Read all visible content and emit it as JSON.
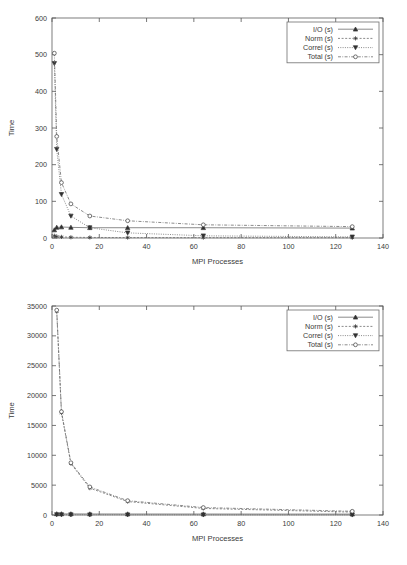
{
  "page": {
    "background_color": "#ffffff",
    "line_color": "#6d6d6d",
    "marker_color": "#2f2f2f",
    "axis_color": "#555555"
  },
  "chart_data": [
    {
      "id": "top",
      "type": "line",
      "title": "",
      "subtitle": "",
      "xlabel": "MPI Processes",
      "ylabel": "Time",
      "xlim": [
        0,
        140
      ],
      "ylim": [
        0,
        600
      ],
      "xticks": [
        0,
        20,
        40,
        60,
        80,
        100,
        120,
        140
      ],
      "xticklabels": [
        "0",
        "20",
        "40",
        "60",
        "80",
        "100",
        "120",
        "140"
      ],
      "yticks": [
        0,
        100,
        200,
        300,
        400,
        500,
        600
      ],
      "yticklabels": [
        "0",
        "100",
        "200",
        "300",
        "400",
        "500",
        "600"
      ],
      "grid": false,
      "legend_position": "upper right",
      "x": [
        1,
        2,
        4,
        8,
        16,
        32,
        64,
        127
      ],
      "series": [
        {
          "name": "I/O (s)",
          "marker": "triangle-up-filled",
          "linestyle": "solid",
          "values": [
            22,
            29,
            30,
            29,
            28,
            28,
            28,
            27
          ]
        },
        {
          "name": "Norm (s)",
          "marker": "star",
          "linestyle": "dashed",
          "values": [
            6,
            4,
            3,
            2,
            1.5,
            1.2,
            1,
            0.9
          ]
        },
        {
          "name": "Correl (s)",
          "marker": "triangle-down-filled",
          "linestyle": "dotted",
          "values": [
            476,
            242,
            119,
            60,
            28,
            14,
            6,
            3
          ]
        },
        {
          "name": "Total (s)",
          "marker": "circle-open",
          "linestyle": "dashdot",
          "values": [
            504,
            277,
            151,
            93,
            60,
            47,
            36,
            31
          ]
        }
      ]
    },
    {
      "id": "bottom",
      "type": "line",
      "title": "",
      "subtitle": "",
      "xlabel": "MPI Processes",
      "ylabel": "Time",
      "xlim": [
        0,
        140
      ],
      "ylim": [
        0,
        35000
      ],
      "xticks": [
        0,
        20,
        40,
        60,
        80,
        100,
        120,
        140
      ],
      "xticklabels": [
        "0",
        "20",
        "40",
        "60",
        "80",
        "100",
        "120",
        "140"
      ],
      "yticks": [
        0,
        5000,
        10000,
        15000,
        20000,
        25000,
        30000,
        35000
      ],
      "yticklabels": [
        "0",
        "5000",
        "10000",
        "15000",
        "20000",
        "25000",
        "30000",
        "35000"
      ],
      "grid": false,
      "legend_position": "upper right",
      "x": [
        2,
        4,
        8,
        16,
        32,
        64,
        127
      ],
      "series": [
        {
          "name": "I/O (s)",
          "marker": "triangle-up-filled",
          "linestyle": "solid",
          "values": [
            190,
            185,
            180,
            170,
            165,
            160,
            150
          ]
        },
        {
          "name": "Norm (s)",
          "marker": "star",
          "linestyle": "dashed",
          "values": [
            34100,
            17100,
            8600,
            4500,
            2250,
            1100,
            480
          ]
        },
        {
          "name": "Correl (s)",
          "marker": "triangle-down-filled",
          "linestyle": "dotted",
          "values": [
            60,
            50,
            45,
            40,
            35,
            30,
            25
          ]
        },
        {
          "name": "Total (s)",
          "marker": "circle-open",
          "linestyle": "dashdot",
          "values": [
            34300,
            17300,
            8750,
            4700,
            2400,
            1250,
            620
          ]
        }
      ]
    }
  ]
}
